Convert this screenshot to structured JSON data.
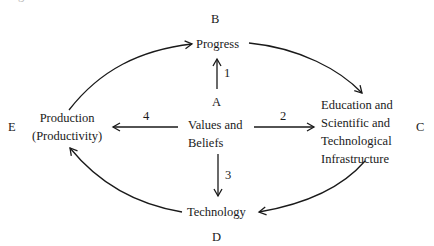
{
  "diagram": {
    "partial_top_text": "g",
    "nodes": {
      "progress": {
        "letter": "B",
        "label": "Progress"
      },
      "values": {
        "letter": "A",
        "lines": [
          "Values and",
          "Beliefs"
        ]
      },
      "education": {
        "letter": "C",
        "lines": [
          "Education and",
          "Scientific and",
          "Technological",
          "Infrastructure"
        ]
      },
      "technology": {
        "letter": "D",
        "label": "Technology"
      },
      "production": {
        "letter": "E",
        "lines": [
          "Production",
          "(Productivity)"
        ]
      }
    },
    "numbered_arrows": [
      {
        "number": "1",
        "from": "Values and Beliefs",
        "to": "Progress"
      },
      {
        "number": "2",
        "from": "Values and Beliefs",
        "to": "Education and Scientific and Technological Infrastructure"
      },
      {
        "number": "3",
        "from": "Values and Beliefs",
        "to": "Technology"
      },
      {
        "number": "4",
        "from": "Values and Beliefs",
        "to": "Production (Productivity)"
      }
    ],
    "cycle_arrows": [
      {
        "from": "Production (Productivity)",
        "to": "Progress"
      },
      {
        "from": "Progress",
        "to": "Education and Scientific and Technological Infrastructure"
      },
      {
        "from": "Education and Scientific and Technological Infrastructure",
        "to": "Technology"
      },
      {
        "from": "Technology",
        "to": "Production (Productivity)"
      }
    ],
    "colors": {
      "ink": "#1a1a1a",
      "background": "#ffffff"
    }
  }
}
